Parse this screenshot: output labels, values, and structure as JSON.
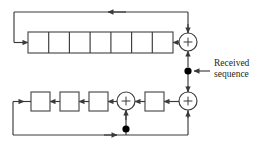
{
  "diagram": {
    "colors": {
      "line": "#3a3a3a",
      "box_stroke": "#4a4a4a",
      "box_fill": "#ffffff",
      "node_fill": "#000000",
      "text": "#231f20"
    },
    "annotations": [
      {
        "id": "received-sequence",
        "line1": "Received",
        "line2": "sequence"
      }
    ],
    "top_register": {
      "name": "top-shift-register",
      "cell_count": 7,
      "cells": [
        "",
        "",
        "",
        "",
        "",
        "",
        ""
      ],
      "x": 28,
      "y": 32,
      "width": 145,
      "height": 21
    },
    "bottom_register": {
      "name": "bottom-shift-register",
      "box_count": 4,
      "boxes": [
        "",
        "",
        "",
        ""
      ],
      "box_size": 19,
      "box_x": [
        31,
        60,
        89,
        145
      ],
      "box_y": 92
    },
    "adders": [
      {
        "id": "adder-top",
        "cx": 188,
        "cy": 42,
        "r": 9,
        "symbol": "+"
      },
      {
        "id": "adder-bottom-mid",
        "cx": 126,
        "cy": 101,
        "r": 9,
        "symbol": "+"
      },
      {
        "id": "adder-bottom-right",
        "cx": 188,
        "cy": 101,
        "r": 9,
        "symbol": "+"
      }
    ],
    "nodes": [
      {
        "id": "node-received-sequence",
        "cx": 188,
        "cy": 71,
        "r": 3.6
      },
      {
        "id": "node-bottom-feedback",
        "cx": 126,
        "cy": 129,
        "r": 3.6
      }
    ],
    "label_position": {
      "x": 214,
      "y": 59
    }
  }
}
